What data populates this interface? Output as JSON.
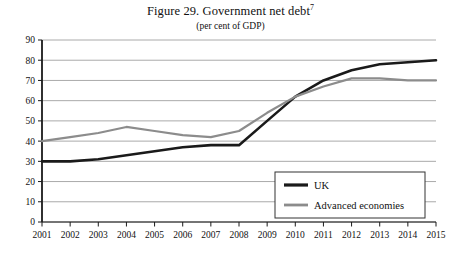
{
  "figure": {
    "title": "Figure 29. Government net debt",
    "title_superscript": "7",
    "subtitle": "(per cent of GDP)"
  },
  "colors": {
    "uk_line": "#1a1a1a",
    "advanced_line": "#8c8c8c",
    "gridline": "#a0a0a0",
    "axis": "#1a1a1a",
    "background": "#ffffff",
    "text": "#111111"
  },
  "chart_data": {
    "type": "line",
    "title": "Figure 29. Government net debt",
    "subtitle": "(per cent of GDP)",
    "xlabel": "",
    "ylabel": "",
    "grid": true,
    "legend_position": "bottom-right",
    "x": [
      2001,
      2002,
      2003,
      2004,
      2005,
      2006,
      2007,
      2008,
      2009,
      2010,
      2011,
      2012,
      2013,
      2014,
      2015
    ],
    "xtick_labels": [
      "2001",
      "2002",
      "2003",
      "2004",
      "2005",
      "2006",
      "2007",
      "2008",
      "2009",
      "2010",
      "2011",
      "2012",
      "2013",
      "2014",
      "2015"
    ],
    "ytick_labels": [
      "0",
      "10",
      "20",
      "30",
      "40",
      "50",
      "60",
      "70",
      "80",
      "90"
    ],
    "yticks": [
      0,
      10,
      20,
      30,
      40,
      50,
      60,
      70,
      80,
      90
    ],
    "ylim": [
      0,
      90
    ],
    "xlim": [
      2001,
      2015
    ],
    "series": [
      {
        "name": "UK",
        "color": "#1a1a1a",
        "width": 2.6,
        "values": [
          30,
          30,
          31,
          33,
          35,
          37,
          38,
          38,
          50,
          62,
          70,
          75,
          78,
          79,
          80
        ]
      },
      {
        "name": "Advanced economies",
        "color": "#8c8c8c",
        "width": 2.2,
        "values": [
          40,
          42,
          44,
          47,
          45,
          43,
          42,
          45,
          54,
          62,
          67,
          71,
          71,
          70,
          70
        ]
      }
    ]
  },
  "legend": {
    "entries": [
      {
        "label": "UK"
      },
      {
        "label": "Advanced economies"
      }
    ]
  }
}
